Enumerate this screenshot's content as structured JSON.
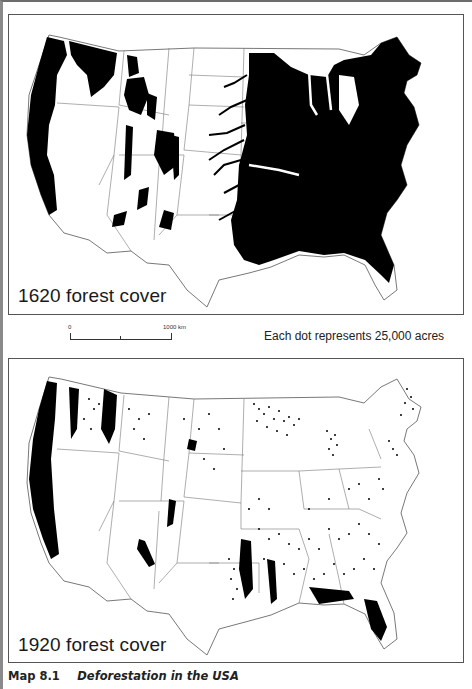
{
  "figure": {
    "caption_number": "Map 8.1",
    "caption_title": "Deforestation in the USA"
  },
  "maps": [
    {
      "id": "map-1620",
      "label": "1620 forest cover",
      "style": "solid-fill",
      "fill_color": "#000000",
      "region": "Contiguous United States"
    },
    {
      "id": "map-1920",
      "label": "1920 forest cover",
      "style": "dot-density",
      "dot_color": "#000000",
      "region": "Contiguous United States"
    }
  ],
  "scale_bar": {
    "start_label": "0",
    "end_label": "1000 km"
  },
  "legend": {
    "dot_note": "Each dot represents 25,000 acres"
  },
  "colors": {
    "forest": "#000000",
    "background": "#ffffff",
    "state_borders": "#555555"
  }
}
